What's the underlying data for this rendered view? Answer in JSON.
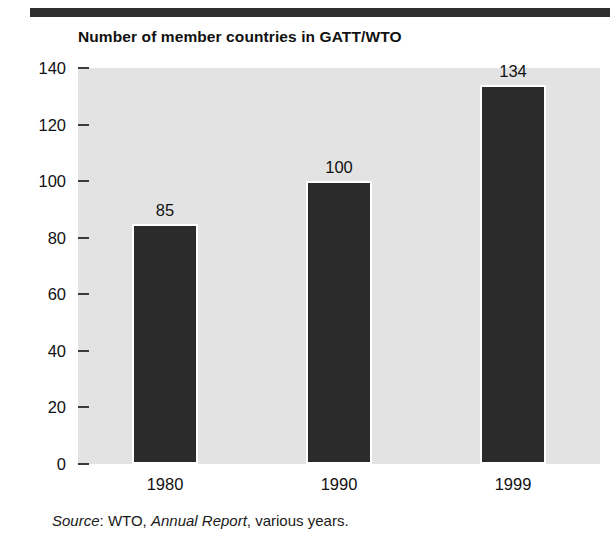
{
  "decoration": {
    "top_rule_color": "#2f2f2f"
  },
  "title": "Number of member countries in GATT/WTO",
  "source": {
    "label": "Source",
    "separator": ": ",
    "publisher": "WTO, ",
    "work": "Annual Report",
    "tail": ", various years."
  },
  "colors": {
    "bar": "#2b2b2b",
    "plot_background": "#e3e3e3",
    "text": "#111111",
    "bar_outline": "#ffffff"
  },
  "chart_data": {
    "type": "bar",
    "title": "Number of member countries in GATT/WTO",
    "xlabel": "",
    "ylabel": "",
    "categories": [
      "1980",
      "1990",
      "1999"
    ],
    "values": [
      85,
      100,
      134
    ],
    "value_labels": [
      "85",
      "100",
      "134"
    ],
    "ylim": [
      0,
      140
    ],
    "ytick_values": [
      0,
      20,
      40,
      60,
      80,
      100,
      120,
      140
    ],
    "ytick_labels": [
      "0",
      "20",
      "40",
      "60",
      "80",
      "100",
      "120",
      "140"
    ],
    "grid": false,
    "legend": false,
    "series": [
      {
        "name": "Number of member countries",
        "values": [
          85,
          100,
          134
        ]
      }
    ]
  }
}
